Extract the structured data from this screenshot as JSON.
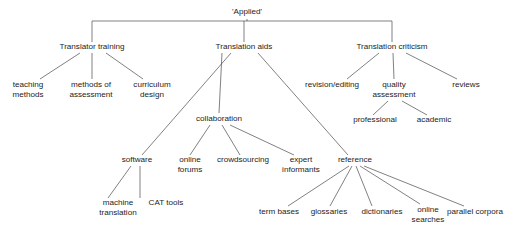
{
  "diagram": {
    "title": "'Applied'",
    "type": "tree-diagram",
    "background_color": "#ffffff",
    "line_color": "#4a4a4a",
    "text_color": "#1c1c1c",
    "nodes": {
      "root": {
        "label": "'Applied'",
        "x": 247,
        "y": 14
      },
      "translator_training": {
        "label": "Translator training",
        "x": 92,
        "y": 49
      },
      "translation_aids": {
        "label": "Translation aids",
        "x": 244,
        "y": 49
      },
      "translation_criticism": {
        "label": "Translation criticism",
        "x": 392,
        "y": 49
      },
      "teaching_methods_l1": {
        "label": "teaching",
        "x": 28,
        "y": 87
      },
      "teaching_methods_l2": {
        "label": "methods",
        "x": 28,
        "y": 97
      },
      "methods_assessment_l1": {
        "label": "methods of",
        "x": 91,
        "y": 87
      },
      "methods_assessment_l2": {
        "label": "assessment",
        "x": 91,
        "y": 97
      },
      "curriculum_design_l1": {
        "label": "curriculum",
        "x": 152,
        "y": 87
      },
      "curriculum_design_l2": {
        "label": "design",
        "x": 152,
        "y": 97
      },
      "revision_editing": {
        "label": "revision/editing",
        "x": 332,
        "y": 87
      },
      "quality_assessment_l1": {
        "label": "quality",
        "x": 394,
        "y": 87
      },
      "quality_assessment_l2": {
        "label": "assessment",
        "x": 394,
        "y": 97
      },
      "reviews": {
        "label": "reviews",
        "x": 466,
        "y": 87
      },
      "professional": {
        "label": "professional",
        "x": 375,
        "y": 122
      },
      "academic": {
        "label": "academic",
        "x": 434,
        "y": 122
      },
      "collaboration": {
        "label": "collaboration",
        "x": 219,
        "y": 121
      },
      "software": {
        "label": "software",
        "x": 137,
        "y": 162
      },
      "online_forums_l1": {
        "label": "online",
        "x": 190,
        "y": 162
      },
      "online_forums_l2": {
        "label": "forums",
        "x": 190,
        "y": 172
      },
      "crowdsourcing": {
        "label": "crowdsourcing",
        "x": 243,
        "y": 162
      },
      "expert_informants_l1": {
        "label": "expert",
        "x": 301,
        "y": 162
      },
      "expert_informants_l2": {
        "label": "informants",
        "x": 301,
        "y": 172
      },
      "reference": {
        "label": "reference",
        "x": 355,
        "y": 162
      },
      "machine_translation_l1": {
        "label": "machine",
        "x": 118,
        "y": 205
      },
      "machine_translation_l2": {
        "label": "translation",
        "x": 118,
        "y": 215
      },
      "cat_tools": {
        "label": "CAT tools",
        "x": 166,
        "y": 205
      },
      "term_bases": {
        "label": "term bases",
        "x": 279,
        "y": 214
      },
      "glossaries": {
        "label": "glossaries",
        "x": 329,
        "y": 214
      },
      "dictionaries": {
        "label": "dictionaries",
        "x": 382,
        "y": 214
      },
      "online_searches_l1": {
        "label": "online",
        "x": 428,
        "y": 212
      },
      "online_searches_l2": {
        "label": "searches",
        "x": 428,
        "y": 222
      },
      "parallel_corpora": {
        "label": "parallel corpora",
        "x": 475,
        "y": 214
      }
    },
    "edges": [
      {
        "name": "root-to-bracket",
        "d": "M 247 19 L 247 21"
      },
      {
        "name": "bracket-horizontal",
        "d": "M 92 21 L 392 21"
      },
      {
        "name": "bracket-stem-left",
        "d": "M 92 21 L 92 42"
      },
      {
        "name": "bracket-stem-mid",
        "d": "M 244 21 L 244 42"
      },
      {
        "name": "bracket-stem-right",
        "d": "M 392 21 L 392 42"
      },
      {
        "name": "tt-to-teaching",
        "d": "M 80 53 L 40 79"
      },
      {
        "name": "tt-to-methods",
        "d": "M 92 53 L 92 79"
      },
      {
        "name": "tt-to-curriculum",
        "d": "M 106 53 L 143 79"
      },
      {
        "name": "ta-to-software",
        "d": "M 231 53 L 142 155"
      },
      {
        "name": "ta-to-collaboration",
        "d": "M 222 53 L 219 113"
      },
      {
        "name": "ta-to-reference",
        "d": "M 258 53 L 348 155"
      },
      {
        "name": "tc-to-revision",
        "d": "M 379 53 L 347 79"
      },
      {
        "name": "tc-to-quality",
        "d": "M 393 53 L 394 79"
      },
      {
        "name": "tc-to-reviews",
        "d": "M 406 53 L 457 79"
      },
      {
        "name": "qa-to-professional",
        "d": "M 388 101 L 373 115"
      },
      {
        "name": "qa-to-academic",
        "d": "M 402 101 L 427 115"
      },
      {
        "name": "collab-to-online",
        "d": "M 210 125 L 190 155"
      },
      {
        "name": "collab-to-crowdsourcing",
        "d": "M 222 125 L 240 155"
      },
      {
        "name": "collab-to-expert",
        "d": "M 230 125 L 294 155"
      },
      {
        "name": "sw-to-machine",
        "d": "M 131 166 L 108 198"
      },
      {
        "name": "sw-to-cat",
        "d": "M 140 166 L 140 198"
      },
      {
        "name": "ref-to-termbases",
        "d": "M 349 166 L 288 206"
      },
      {
        "name": "ref-to-glossaries",
        "d": "M 352 166 L 330 206"
      },
      {
        "name": "ref-to-dictionaries",
        "d": "M 356 166 L 372 206"
      },
      {
        "name": "ref-to-online",
        "d": "M 360 166 L 420 204"
      },
      {
        "name": "ref-to-parallel",
        "d": "M 364 166 L 464 206"
      }
    ]
  }
}
